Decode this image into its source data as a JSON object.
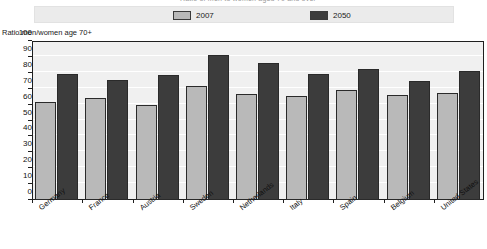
{
  "figure": {
    "clipped_title": "Ratio of men to women aged 70 and over",
    "axis_caption": "Ratio men/women age 70+"
  },
  "legend": {
    "entries": [
      {
        "label": "2007",
        "color": "#b9b9b9",
        "swatch_name": "legend-swatch-2007"
      },
      {
        "label": "2050",
        "color": "#3c3c3c",
        "swatch_name": "legend-swatch-2050"
      }
    ]
  },
  "chart_data": {
    "type": "bar",
    "title": "Ratio of men to women aged 70 and over",
    "xlabel": "",
    "ylabel": "Ratio men/women age 70+",
    "ylim": [
      0,
      100
    ],
    "yticks": [
      0,
      10,
      20,
      30,
      40,
      50,
      60,
      70,
      80,
      90,
      100
    ],
    "grid": true,
    "legend_position": "top",
    "categories": [
      "Germany",
      "France",
      "Austria",
      "Sweden",
      "Netherlands",
      "Italy",
      "Spain",
      "Belgium",
      "United States"
    ],
    "series": [
      {
        "name": "2007",
        "color": "#b9b9b9",
        "values": [
          61.5,
          64,
          59.5,
          71.5,
          66.5,
          65.5,
          69.5,
          66,
          67.5
        ]
      },
      {
        "name": "2050",
        "color": "#3c3c3c",
        "values": [
          79,
          75.5,
          78.5,
          91,
          86,
          79.5,
          82.5,
          75,
          81
        ]
      }
    ]
  }
}
